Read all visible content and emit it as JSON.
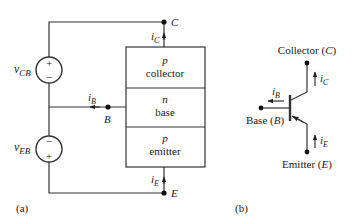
{
  "figure_a": {
    "caption": "(a)",
    "sources": [
      {
        "name": "v_CB",
        "symbol": "v",
        "subscript": "CB",
        "top_sign": "+",
        "bottom_sign": "−"
      },
      {
        "name": "v_EB",
        "symbol": "v",
        "subscript": "EB",
        "top_sign": "−",
        "bottom_sign": "+"
      }
    ],
    "regions": [
      {
        "type": "p",
        "label": "collector"
      },
      {
        "type": "n",
        "label": "base"
      },
      {
        "type": "p",
        "label": "emitter"
      }
    ],
    "terminals": {
      "collector": "C",
      "base": "B",
      "emitter": "E"
    },
    "currents": {
      "ic": {
        "symbol": "i",
        "subscript": "C"
      },
      "ib": {
        "symbol": "i",
        "subscript": "B"
      },
      "ie": {
        "symbol": "i",
        "subscript": "E"
      }
    }
  },
  "figure_b": {
    "caption": "(b)",
    "collector_label": "Collector",
    "collector_terminal": "C",
    "base_label": "Base",
    "base_terminal": "B",
    "emitter_label": "Emitter",
    "emitter_terminal": "E",
    "currents": {
      "ic": {
        "symbol": "i",
        "subscript": "C"
      },
      "ib": {
        "symbol": "i",
        "subscript": "B"
      },
      "ie": {
        "symbol": "i",
        "subscript": "E"
      }
    }
  },
  "colors": {
    "line": "#222222",
    "background": "#ffffff"
  }
}
